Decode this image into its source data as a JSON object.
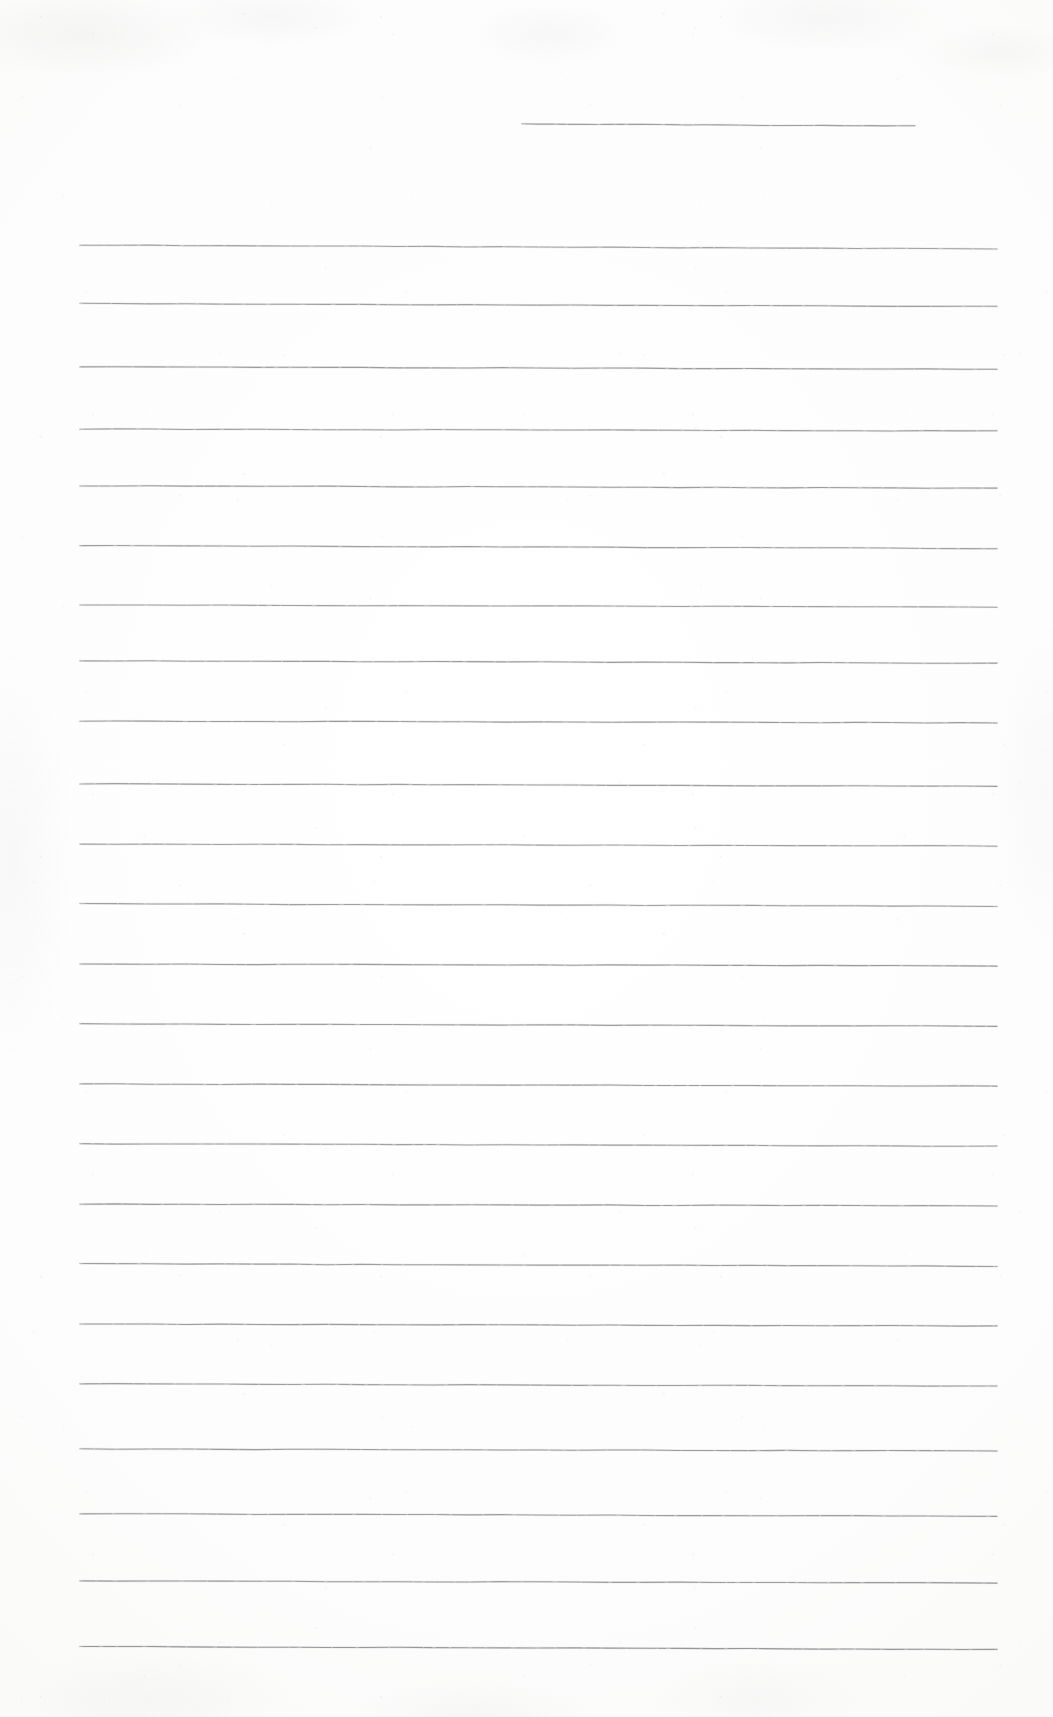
{
  "document": {
    "type": "scanned-ruled-notepad-page",
    "title": "Blank ruled notepad page",
    "content_text": "",
    "width_px": 1053,
    "height_px": 1717,
    "paper_color": "#fdfdfc",
    "rule_color": "#55565a",
    "rule_count": 23,
    "has_handwriting": false,
    "has_printed_text": false,
    "page_number": "",
    "header_text": "",
    "footer_text": ""
  },
  "rules": {
    "left_margin_x": 80,
    "right_margin_x": 997,
    "first_line_y": 125,
    "line_spacing_px": 65.5,
    "stroke_width_px": 1.1,
    "opacity": 0.62,
    "lines": [
      {
        "id": "rule-01",
        "y": 125,
        "x_start": 522,
        "x_end": 915,
        "tilt": 2.0,
        "opacity": 0.6,
        "partial": true
      },
      {
        "id": "rule-02",
        "y": 247,
        "x_start": 80,
        "x_end": 997,
        "tilt": 4.0,
        "opacity": 0.58,
        "partial": false
      },
      {
        "id": "rule-03",
        "y": 305,
        "x_start": 80,
        "x_end": 997,
        "tilt": 3.0,
        "opacity": 0.6,
        "partial": false
      },
      {
        "id": "rule-04",
        "y": 368,
        "x_start": 80,
        "x_end": 997,
        "tilt": 2.5,
        "opacity": 0.62,
        "partial": false
      },
      {
        "id": "rule-05",
        "y": 430,
        "x_start": 80,
        "x_end": 997,
        "tilt": 2.0,
        "opacity": 0.6,
        "partial": false
      },
      {
        "id": "rule-06",
        "y": 487,
        "x_start": 80,
        "x_end": 997,
        "tilt": 2.5,
        "opacity": 0.62,
        "partial": false
      },
      {
        "id": "rule-07",
        "y": 547,
        "x_start": 80,
        "x_end": 997,
        "tilt": 3.0,
        "opacity": 0.6,
        "partial": false
      },
      {
        "id": "rule-08",
        "y": 606,
        "x_start": 80,
        "x_end": 997,
        "tilt": 2.0,
        "opacity": 0.58,
        "partial": false
      },
      {
        "id": "rule-09",
        "y": 662,
        "x_start": 80,
        "x_end": 997,
        "tilt": 2.5,
        "opacity": 0.62,
        "partial": false
      },
      {
        "id": "rule-10",
        "y": 722,
        "x_start": 80,
        "x_end": 997,
        "tilt": 2.0,
        "opacity": 0.62,
        "partial": false
      },
      {
        "id": "rule-11",
        "y": 785,
        "x_start": 80,
        "x_end": 997,
        "tilt": 2.5,
        "opacity": 0.6,
        "partial": false
      },
      {
        "id": "rule-12",
        "y": 845,
        "x_start": 80,
        "x_end": 997,
        "tilt": 2.0,
        "opacity": 0.58,
        "partial": false
      },
      {
        "id": "rule-13",
        "y": 905,
        "x_start": 80,
        "x_end": 997,
        "tilt": 2.5,
        "opacity": 0.6,
        "partial": false
      },
      {
        "id": "rule-14",
        "y": 965,
        "x_start": 80,
        "x_end": 997,
        "tilt": 2.0,
        "opacity": 0.62,
        "partial": false
      },
      {
        "id": "rule-15",
        "y": 1025,
        "x_start": 80,
        "x_end": 997,
        "tilt": 2.5,
        "opacity": 0.6,
        "partial": false
      },
      {
        "id": "rule-16",
        "y": 1085,
        "x_start": 80,
        "x_end": 997,
        "tilt": 2.0,
        "opacity": 0.62,
        "partial": false
      },
      {
        "id": "rule-17",
        "y": 1145,
        "x_start": 80,
        "x_end": 997,
        "tilt": 2.5,
        "opacity": 0.6,
        "partial": false
      },
      {
        "id": "rule-18",
        "y": 1205,
        "x_start": 80,
        "x_end": 997,
        "tilt": 2.0,
        "opacity": 0.62,
        "partial": false
      },
      {
        "id": "rule-19",
        "y": 1265,
        "x_start": 80,
        "x_end": 997,
        "tilt": 2.5,
        "opacity": 0.6,
        "partial": false
      },
      {
        "id": "rule-20",
        "y": 1325,
        "x_start": 80,
        "x_end": 997,
        "tilt": 2.0,
        "opacity": 0.62,
        "partial": false
      },
      {
        "id": "rule-21",
        "y": 1385,
        "x_start": 80,
        "x_end": 997,
        "tilt": 2.5,
        "opacity": 0.6,
        "partial": false
      },
      {
        "id": "rule-22",
        "y": 1450,
        "x_start": 80,
        "x_end": 997,
        "tilt": 2.0,
        "opacity": 0.62,
        "partial": false
      },
      {
        "id": "rule-23",
        "y": 1515,
        "x_start": 80,
        "x_end": 997,
        "tilt": 2.5,
        "opacity": 0.6,
        "partial": false
      },
      {
        "id": "rule-24",
        "y": 1582,
        "x_start": 80,
        "x_end": 997,
        "tilt": 2.0,
        "opacity": 0.62,
        "partial": false
      },
      {
        "id": "rule-25",
        "y": 1648,
        "x_start": 80,
        "x_end": 997,
        "tilt": 3.0,
        "opacity": 0.64,
        "partial": false
      }
    ]
  }
}
